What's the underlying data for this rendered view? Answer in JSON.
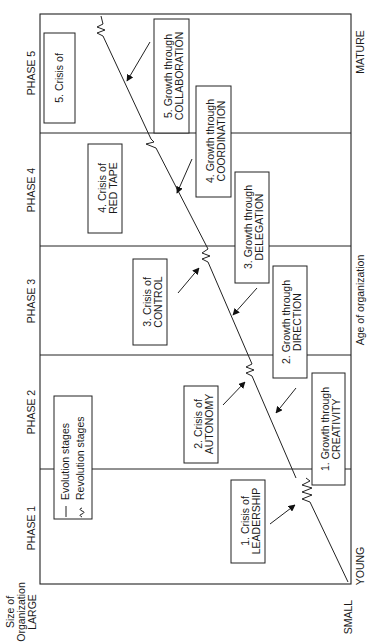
{
  "diagram": {
    "axis": {
      "y_label_line1": "Size of",
      "y_label_line2": "Organization",
      "y_high": "LARGE",
      "y_low": "SMALL",
      "x_label": "Age of organization",
      "x_low": "YOUNG",
      "x_high": "MATURE"
    },
    "phases": [
      {
        "label": "PHASE 1"
      },
      {
        "label": "PHASE 2"
      },
      {
        "label": "PHASE 3"
      },
      {
        "label": "PHASE 4"
      },
      {
        "label": "PHASE 5"
      }
    ],
    "legend": {
      "evolution": "Evolution stages",
      "revolution": "Revolution stages"
    },
    "crises": [
      {
        "line1": "1.  Crisis of",
        "line2": "LEADERSHIP"
      },
      {
        "line1": "2.  Crisis of",
        "line2": "AUTONOMY"
      },
      {
        "line1": "3.  Crisis of",
        "line2": "CONTROL"
      },
      {
        "line1": "4.  Crisis of",
        "line2": "RED TAPE"
      },
      {
        "line1": "5.  Crisis of",
        "line2": ""
      }
    ],
    "growth": [
      {
        "line1": "1.  Growth through",
        "line2": "CREATIVITY"
      },
      {
        "line1": "2.  Growth through",
        "line2": "DIRECTION"
      },
      {
        "line1": "3.  Growth through",
        "line2": "DELEGATION"
      },
      {
        "line1": "4.  Growth through",
        "line2": "COORDINATION"
      },
      {
        "line1": "5.  Growth through",
        "line2": "COLLABORATION"
      }
    ]
  }
}
